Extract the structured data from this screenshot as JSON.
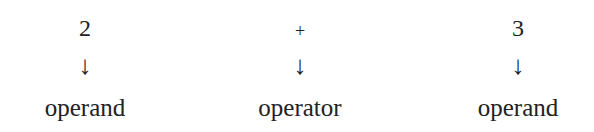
{
  "diagram": {
    "columns": [
      {
        "symbol": "2",
        "arrow": "↓",
        "label": "operand"
      },
      {
        "symbol": "+",
        "arrow": "↓",
        "label": "operator"
      },
      {
        "symbol": "3",
        "arrow": "↓",
        "label": "operand"
      }
    ]
  }
}
